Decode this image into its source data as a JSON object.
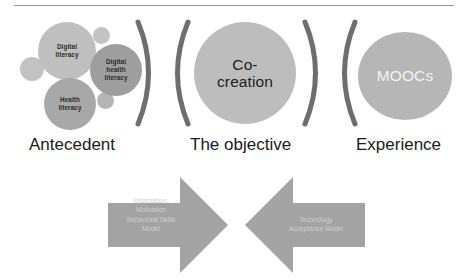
{
  "diagram": {
    "colors": {
      "bubble_light": "#bfbfbf",
      "bubble_medium": "#9e9e9e",
      "circle_main": "#bdbdbd",
      "circle_moocs": "#b6b6b6",
      "arc_stroke": "#6e6e6e",
      "arrow_fill": "#a3a3a3",
      "arrow_text": "#cfcfcf",
      "caption_text": "#1a1a1a",
      "rule": "#9a9a9a"
    }
  },
  "antecedent": {
    "caption": "Antecedent",
    "bubbles": [
      {
        "id": "digital-literacy",
        "label": "Digital\nliteracy"
      },
      {
        "id": "digital-health-literacy",
        "label": "Digital\nhealth\nliteracy"
      },
      {
        "id": "health-literacy",
        "label": "Health\nliteracy"
      }
    ],
    "accent_dots": 3
  },
  "objective": {
    "caption": "The objective",
    "circle_label": "Co-\ncreation"
  },
  "experience": {
    "caption": "Experience",
    "circle_label": "MOOCs"
  },
  "arrows": [
    {
      "id": "imb",
      "direction": "right",
      "label": "Information-\nMotivation\nBehavioral Skills\nModel"
    },
    {
      "id": "tam",
      "direction": "left",
      "label": "Technology\nAcceptance Model"
    }
  ]
}
